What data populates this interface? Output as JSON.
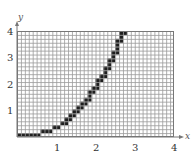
{
  "chart_data": {
    "type": "line",
    "title": "",
    "xlabel": "x",
    "ylabel": "y",
    "xlim": [
      0,
      4
    ],
    "ylim": [
      0,
      4
    ],
    "grid": true,
    "x_ticks": [
      "1",
      "2",
      "3",
      "4"
    ],
    "y_ticks": [
      "1",
      "2",
      "3",
      "4"
    ],
    "grid_cols": 40,
    "grid_rows": 27,
    "style": "rasterized staircase of filled grid cells",
    "filled_cells_by_row": [
      [
        0,
        5
      ],
      [
        6,
        8
      ],
      [
        9,
        10
      ],
      [
        11,
        12
      ],
      [
        12,
        13
      ],
      [
        13,
        14
      ],
      [
        14,
        15
      ],
      [
        15,
        16
      ],
      [
        16,
        17
      ],
      [
        17,
        18
      ],
      [
        18,
        18
      ],
      [
        18,
        19
      ],
      [
        19,
        20
      ],
      [
        20,
        20
      ],
      [
        20,
        21
      ],
      [
        21,
        22
      ],
      [
        22,
        22
      ],
      [
        22,
        23
      ],
      [
        23,
        23
      ],
      [
        23,
        24
      ],
      [
        24,
        24
      ],
      [
        24,
        25
      ],
      [
        25,
        25
      ],
      [
        25,
        25
      ],
      [
        25,
        26
      ],
      [
        26,
        26
      ],
      [
        26,
        27
      ]
    ],
    "series": [
      {
        "name": "curve",
        "x": [
          0.0,
          0.6,
          0.7,
          0.9,
          1.1,
          1.3,
          1.5,
          1.7,
          1.85,
          2.0,
          2.1,
          2.25,
          2.4,
          2.5,
          2.6,
          2.7,
          2.8
        ],
        "y": [
          0.0,
          0.0,
          0.15,
          0.3,
          0.6,
          0.9,
          1.2,
          1.45,
          1.75,
          2.0,
          2.3,
          2.6,
          2.9,
          3.2,
          3.5,
          3.75,
          4.0
        ]
      }
    ]
  },
  "colors": {
    "grid_line": "#9a9a9a",
    "frame": "#777777",
    "fill": "#1e1e1e",
    "text": "#333333"
  }
}
